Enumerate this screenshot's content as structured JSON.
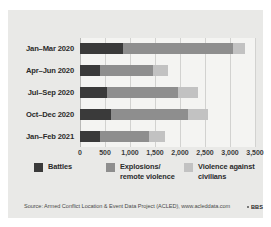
{
  "chart_data": {
    "type": "bar",
    "orientation": "horizontal",
    "stacked": true,
    "title": "",
    "xlabel": "",
    "ylabel": "",
    "xlim": [
      0,
      3500
    ],
    "grid": true,
    "legend_position": "bottom",
    "categories": [
      "Jan–Mar 2020",
      "Apr–Jun 2020",
      "Jul–Sep 2020",
      "Oct–Dec 2020",
      "Jan–Feb 2021"
    ],
    "xticks": [
      0,
      500,
      1000,
      1500,
      2000,
      2500,
      3000,
      3500
    ],
    "xticklabels": [
      "0",
      "500",
      "1,000",
      "1,500",
      "2,000",
      "2,500",
      "3,000",
      "3,500"
    ],
    "series": [
      {
        "name": "Battles",
        "color": "#3a3a3a",
        "values": [
          850,
          400,
          540,
          610,
          390
        ]
      },
      {
        "name": "Explosions/ remote violence",
        "color": "#8e8e8e",
        "values": [
          2200,
          1050,
          1420,
          1540,
          980
        ]
      },
      {
        "name": "Violence against civilians",
        "color": "#c2c2c2",
        "values": [
          250,
          300,
          390,
          400,
          330
        ]
      }
    ],
    "totals": [
      3300,
      1750,
      2350,
      2550,
      1700
    ]
  },
  "legend": {
    "items": [
      {
        "label": "Battles",
        "color": "#3a3a3a"
      },
      {
        "label": "Explosions/\nremote violence",
        "color": "#8e8e8e"
      },
      {
        "label": "Violence against\ncivilians",
        "color": "#c2c2c2"
      }
    ]
  },
  "source": {
    "text": "Source: Armed Conflict Location & Event Data Project (ACLED), www.acleddata.com",
    "logo": "BBS"
  }
}
